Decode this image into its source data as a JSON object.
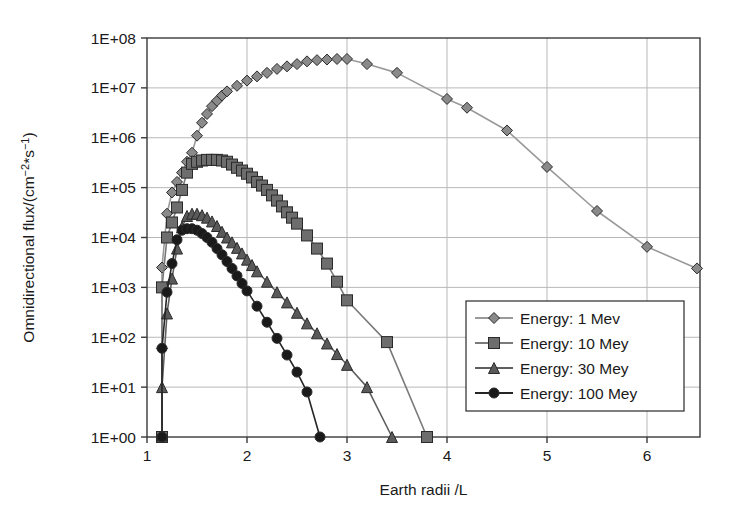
{
  "chart_data": {
    "type": "line",
    "title": "",
    "xlabel": "Earth radii /L",
    "ylabel": "Omnidirectional flux/(cm⁻²*s⁻¹)",
    "ylabel_parts": {
      "prefix": "Omnidirectional flux/(cm",
      "sup1": "−2",
      "mid": "*s",
      "sup2": "−1",
      "suffix": ")"
    },
    "xlim": [
      1.0,
      6.53
    ],
    "ylim": [
      1,
      100000000
    ],
    "yscale": "log",
    "xscale": "linear",
    "grid": true,
    "grid_color": "#b8b8b8",
    "axis_color": "#3a3a3a",
    "background": "#ffffff",
    "xticks": [
      1,
      2,
      3,
      4,
      5,
      6
    ],
    "xtick_labels": [
      "1",
      "2",
      "3",
      "4",
      "5",
      "6"
    ],
    "yticks": [
      1,
      10,
      100,
      1000,
      10000,
      100000,
      1000000,
      10000000,
      100000000
    ],
    "ytick_labels": [
      "1E+00",
      "1E+01",
      "1E+02",
      "1E+03",
      "1E+04",
      "1E+05",
      "1E+06",
      "1E+07",
      "1E+08"
    ],
    "legend_position": "lower-right",
    "series": [
      {
        "name": "Energy: 1 Mev",
        "marker": "diamond",
        "color": "#8a8a8a",
        "line_color": "#9a9a9a",
        "marker_size": 11,
        "x": [
          1.15,
          1.15,
          1.15,
          1.2,
          1.25,
          1.3,
          1.35,
          1.4,
          1.45,
          1.5,
          1.55,
          1.6,
          1.65,
          1.7,
          1.75,
          1.8,
          1.9,
          2.0,
          2.1,
          2.2,
          2.3,
          2.4,
          2.5,
          2.6,
          2.7,
          2.8,
          2.9,
          3.0,
          3.2,
          3.5,
          4.0,
          4.2,
          4.6,
          5.0,
          5.5,
          6.0,
          6.5
        ],
        "y": [
          1.0,
          60.0,
          2500.0,
          30000.0,
          80000.0,
          130000.0,
          200000.0,
          330000.0,
          500000.0,
          1100000.0,
          2000000.0,
          3000000.0,
          4300000.0,
          5500000.0,
          7000000.0,
          8500000.0,
          11000000.0,
          14000000.0,
          17000000.0,
          20000000.0,
          24000000.0,
          27000000.0,
          30000000.0,
          34000000.0,
          36000000.0,
          37000000.0,
          38000000.0,
          38000000.0,
          30000000.0,
          20000000.0,
          6000000.0,
          4000000.0,
          1400000.0,
          260000.0,
          34000.0,
          6500.0,
          2400.0
        ]
      },
      {
        "name": "Energy: 10 Mey",
        "marker": "square",
        "color": "#6d6d6d",
        "line_color": "#7a7a7a",
        "marker_size": 11,
        "x": [
          1.15,
          1.15,
          1.2,
          1.25,
          1.3,
          1.35,
          1.4,
          1.45,
          1.5,
          1.55,
          1.6,
          1.65,
          1.7,
          1.75,
          1.8,
          1.85,
          1.9,
          1.95,
          2.0,
          2.05,
          2.1,
          2.15,
          2.2,
          2.25,
          2.3,
          2.35,
          2.4,
          2.45,
          2.5,
          2.6,
          2.7,
          2.8,
          2.9,
          3.0,
          3.4,
          3.8
        ],
        "y": [
          1.0,
          1000.0,
          10000.0,
          20000.0,
          40000.0,
          90000.0,
          200000.0,
          300000.0,
          330000.0,
          350000.0,
          360000.0,
          360000.0,
          360000.0,
          350000.0,
          330000.0,
          290000.0,
          250000.0,
          220000.0,
          190000.0,
          160000.0,
          130000.0,
          110000.0,
          90000.0,
          70000.0,
          55000.0,
          42000.0,
          32000.0,
          25000.0,
          19000.0,
          11000.0,
          6000.0,
          3000.0,
          1300.0,
          550.0,
          80.0,
          1.0
        ]
      },
      {
        "name": "Energy: 30 Mey",
        "marker": "triangle",
        "color": "#5a5a5a",
        "line_color": "#5f5f5f",
        "marker_size": 11,
        "x": [
          1.15,
          1.15,
          1.2,
          1.25,
          1.3,
          1.35,
          1.4,
          1.45,
          1.5,
          1.55,
          1.6,
          1.65,
          1.7,
          1.75,
          1.8,
          1.85,
          1.9,
          1.95,
          2.0,
          2.05,
          2.1,
          2.2,
          2.3,
          2.4,
          2.5,
          2.6,
          2.7,
          2.8,
          2.9,
          3.0,
          3.2,
          3.45
        ],
        "y": [
          1.0,
          10.0,
          300.0,
          1500.0,
          6000.0,
          16000.0,
          27000.0,
          30000.0,
          30000.0,
          28000.0,
          25000.0,
          21000.0,
          17000.0,
          13000.0,
          10000.0,
          8000.0,
          6200.0,
          4800.0,
          3600.0,
          2800.0,
          2100.0,
          1300.0,
          800.0,
          500.0,
          310.0,
          190.0,
          120.0,
          75.0,
          46.0,
          28.0,
          10.0,
          1.0
        ]
      },
      {
        "name": "Energy: 100 Mey",
        "marker": "circle",
        "color": "#1a1a1a",
        "line_color": "#252525",
        "marker_size": 10,
        "x": [
          1.15,
          1.15,
          1.2,
          1.25,
          1.3,
          1.35,
          1.4,
          1.45,
          1.5,
          1.55,
          1.6,
          1.65,
          1.7,
          1.75,
          1.8,
          1.85,
          1.9,
          1.95,
          2.0,
          2.1,
          2.2,
          2.3,
          2.4,
          2.5,
          2.6,
          2.73
        ],
        "y": [
          1.0,
          60.0,
          800.0,
          3000.0,
          9000.0,
          14000.0,
          15000.0,
          15000.0,
          14000.0,
          12000.0,
          10000.0,
          8000.0,
          6000.0,
          4500.0,
          3300.0,
          2400.0,
          1700.0,
          1200.0,
          850.0,
          420.0,
          200.0,
          95.0,
          44.0,
          20.0,
          8.0,
          1.0
        ]
      }
    ]
  },
  "legend": {
    "items": [
      {
        "label": "Energy: 1 Mev"
      },
      {
        "label": "Energy: 10 Mey"
      },
      {
        "label": "Energy: 30 Mey"
      },
      {
        "label": "Energy: 100 Mey"
      }
    ]
  }
}
